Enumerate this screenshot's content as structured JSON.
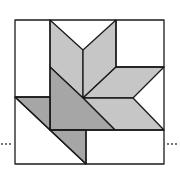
{
  "diagram": {
    "title": "",
    "colors": {
      "light_gray": "#c6c6c6",
      "dark_gray": "#a6a6a6",
      "white": "#ffffff",
      "stroke": "#1a1a1a"
    },
    "continuation_marks": {
      "left": "...",
      "right": "..."
    }
  }
}
